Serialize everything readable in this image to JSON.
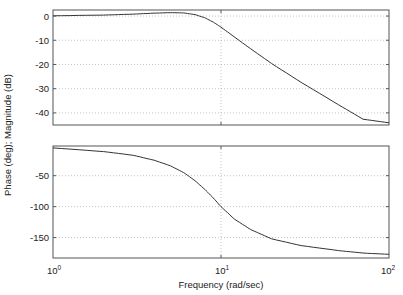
{
  "chart_data": {
    "type": "line",
    "title": "",
    "xlabel": "Frequency (rad/sec)",
    "ylabel": "Phase (deg); Magnitude (dB)",
    "xscale": "log",
    "xlim": [
      1,
      100
    ],
    "x_tick_labels": [
      "10^0",
      "10^1",
      "10^2"
    ],
    "grid": true,
    "subplots": [
      {
        "name": "magnitude",
        "ylabel": "Magnitude (dB)",
        "ylim": [
          -45,
          2.5
        ],
        "y_ticks": [
          0,
          -10,
          -20,
          -30,
          -40
        ],
        "x": [
          1,
          2,
          3,
          4,
          5,
          6,
          7,
          8,
          9,
          10,
          12,
          15,
          20,
          30,
          50,
          70,
          100
        ],
        "values": [
          0.1,
          0.4,
          0.8,
          1.2,
          1.4,
          1.3,
          0.6,
          -0.7,
          -2.5,
          -4.6,
          -8.6,
          -13.5,
          -19.6,
          -27.4,
          -36.6,
          -42.6,
          -44.1
        ]
      },
      {
        "name": "phase",
        "ylabel": "Phase (deg)",
        "ylim": [
          -183,
          -2
        ],
        "y_ticks": [
          -50,
          -100,
          -150
        ],
        "x": [
          1,
          2,
          3,
          4,
          5,
          6,
          7,
          8,
          9,
          10,
          12,
          15,
          20,
          30,
          50,
          70,
          100
        ],
        "values": [
          -5,
          -11,
          -17,
          -25,
          -34,
          -45,
          -58,
          -72,
          -86,
          -100,
          -120,
          -137,
          -152,
          -163,
          -171,
          -175,
          -177
        ]
      }
    ]
  },
  "axes": {
    "mag_ticks": [
      "0",
      "-10",
      "-20",
      "-30",
      "-40"
    ],
    "phase_ticks": [
      "-50",
      "-100",
      "-150"
    ],
    "x_base": [
      "10",
      "10",
      "10"
    ],
    "x_exp": [
      "0",
      "1",
      "2"
    ],
    "xlabel": "Frequency (rad/sec)",
    "ylabel": "Phase (deg); Magnitude (dB)"
  }
}
